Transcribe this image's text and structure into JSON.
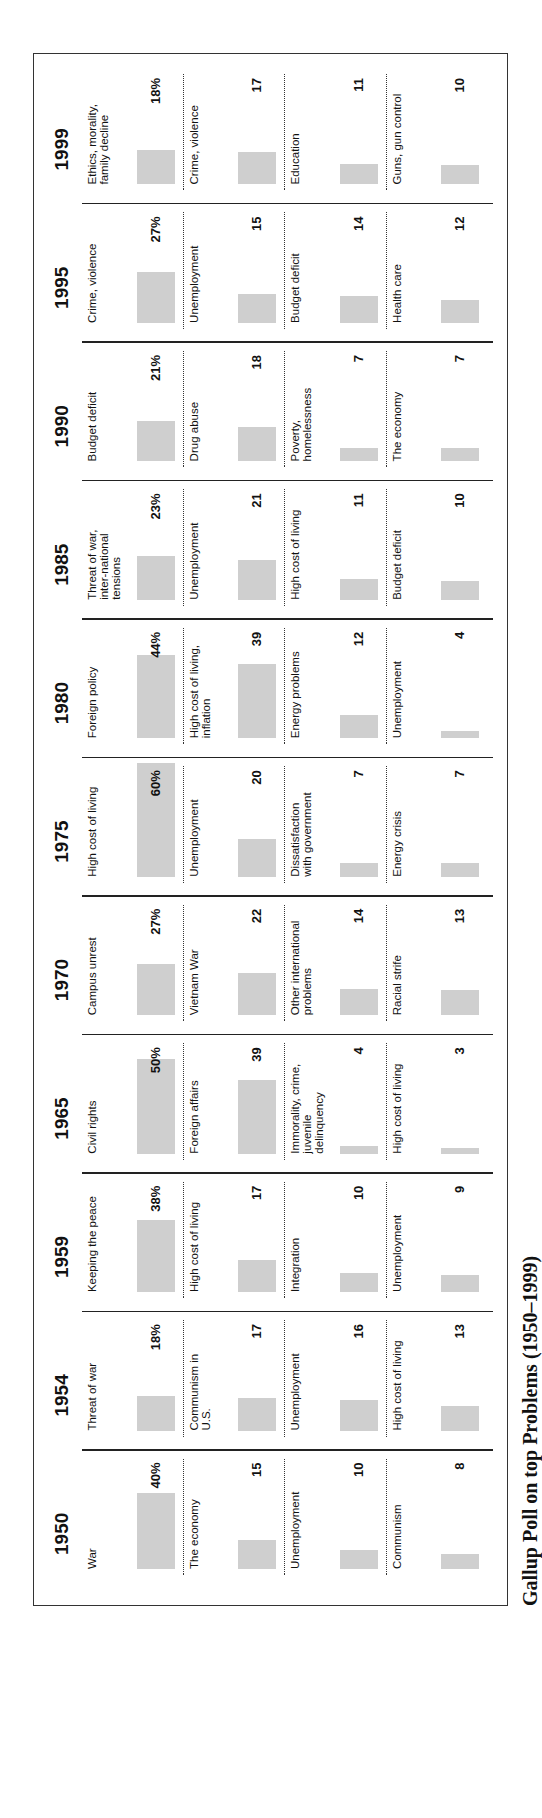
{
  "caption": "Gallup Poll on top Problems (1950–1999)",
  "colors": {
    "bar": "#cfcfcf",
    "rule": "#222222"
  },
  "chart_data": {
    "type": "table",
    "unit": "percent of respondents",
    "years": [
      {
        "year": "1950",
        "items": [
          {
            "label": "War",
            "value": 40,
            "display": "40%"
          },
          {
            "label": "The economy",
            "value": 15,
            "display": "15"
          },
          {
            "label": "Unemployment",
            "value": 10,
            "display": "10"
          },
          {
            "label": "Communism",
            "value": 8,
            "display": "8"
          }
        ]
      },
      {
        "year": "1954",
        "items": [
          {
            "label": "Threat of war",
            "value": 18,
            "display": "18%"
          },
          {
            "label": "Communism in U.S.",
            "value": 17,
            "display": "17"
          },
          {
            "label": "Unemployment",
            "value": 16,
            "display": "16"
          },
          {
            "label": "High cost of living",
            "value": 13,
            "display": "13"
          }
        ]
      },
      {
        "year": "1959",
        "items": [
          {
            "label": "Keeping the peace",
            "value": 38,
            "display": "38%"
          },
          {
            "label": "High cost of living",
            "value": 17,
            "display": "17"
          },
          {
            "label": "Integration",
            "value": 10,
            "display": "10"
          },
          {
            "label": "Unemployment",
            "value": 9,
            "display": "9"
          }
        ]
      },
      {
        "year": "1965",
        "items": [
          {
            "label": "Civil rights",
            "value": 50,
            "display": "50%"
          },
          {
            "label": "Foreign affairs",
            "value": 39,
            "display": "39"
          },
          {
            "label": "Immorality, crime, juvenile delinquency",
            "value": 4,
            "display": "4"
          },
          {
            "label": "High cost of living",
            "value": 3,
            "display": "3"
          }
        ]
      },
      {
        "year": "1970",
        "items": [
          {
            "label": "Campus unrest",
            "value": 27,
            "display": "27%"
          },
          {
            "label": "Vietnam War",
            "value": 22,
            "display": "22"
          },
          {
            "label": "Other international problems",
            "value": 14,
            "display": "14"
          },
          {
            "label": "Racial strife",
            "value": 13,
            "display": "13"
          }
        ]
      },
      {
        "year": "1975",
        "items": [
          {
            "label": "High cost of living",
            "value": 60,
            "display": "60%"
          },
          {
            "label": "Unemployment",
            "value": 20,
            "display": "20"
          },
          {
            "label": "Dissatisfaction with government",
            "value": 7,
            "display": "7"
          },
          {
            "label": "Energy crisis",
            "value": 7,
            "display": "7"
          }
        ]
      },
      {
        "year": "1980",
        "items": [
          {
            "label": "Foreign policy",
            "value": 44,
            "display": "44%"
          },
          {
            "label": "High cost of living, inflation",
            "value": 39,
            "display": "39"
          },
          {
            "label": "Energy problems",
            "value": 12,
            "display": "12"
          },
          {
            "label": "Unemployment",
            "value": 4,
            "display": "4"
          }
        ]
      },
      {
        "year": "1985",
        "items": [
          {
            "label": "Threat of war, inter-national tensions",
            "value": 23,
            "display": "23%"
          },
          {
            "label": "Unemployment",
            "value": 21,
            "display": "21"
          },
          {
            "label": "High cost of living",
            "value": 11,
            "display": "11"
          },
          {
            "label": "Budget deficit",
            "value": 10,
            "display": "10"
          }
        ]
      },
      {
        "year": "1990",
        "items": [
          {
            "label": "Budget deficit",
            "value": 21,
            "display": "21%"
          },
          {
            "label": "Drug abuse",
            "value": 18,
            "display": "18"
          },
          {
            "label": "Poverty, homelessness",
            "value": 7,
            "display": "7"
          },
          {
            "label": "The economy",
            "value": 7,
            "display": "7"
          }
        ]
      },
      {
        "year": "1995",
        "items": [
          {
            "label": "Crime, violence",
            "value": 27,
            "display": "27%"
          },
          {
            "label": "Unemployment",
            "value": 15,
            "display": "15"
          },
          {
            "label": "Budget deficit",
            "value": 14,
            "display": "14"
          },
          {
            "label": "Health care",
            "value": 12,
            "display": "12"
          }
        ]
      },
      {
        "year": "1999",
        "items": [
          {
            "label": "Ethics, morality, family decline",
            "value": 18,
            "display": "18%"
          },
          {
            "label": "Crime, violence",
            "value": 17,
            "display": "17"
          },
          {
            "label": "Education",
            "value": 11,
            "display": "11"
          },
          {
            "label": "Guns, gun control",
            "value": 10,
            "display": "10"
          }
        ]
      }
    ]
  }
}
